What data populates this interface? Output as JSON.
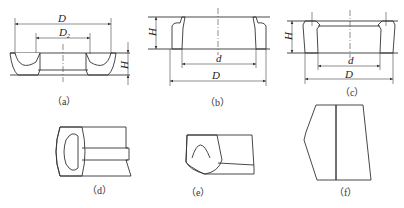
{
  "figure": {
    "panels": [
      {
        "id": "a",
        "caption": "（a）",
        "dimensions": {
          "outer": "D",
          "inner": "D",
          "inner_sub": "2",
          "height": "H"
        }
      },
      {
        "id": "b",
        "caption": "（b）",
        "dimensions": {
          "height": "H",
          "inner": "d",
          "outer": "D"
        }
      },
      {
        "id": "c",
        "caption": "（c）",
        "dimensions": {
          "height": "H",
          "inner": "d",
          "outer": "D"
        }
      },
      {
        "id": "d",
        "caption": "（d）"
      },
      {
        "id": "e",
        "caption": "（e）"
      },
      {
        "id": "f",
        "caption": "（f）"
      }
    ]
  },
  "colors": {
    "line": "#333333",
    "hatch": "#555555",
    "background": "#ffffff"
  }
}
